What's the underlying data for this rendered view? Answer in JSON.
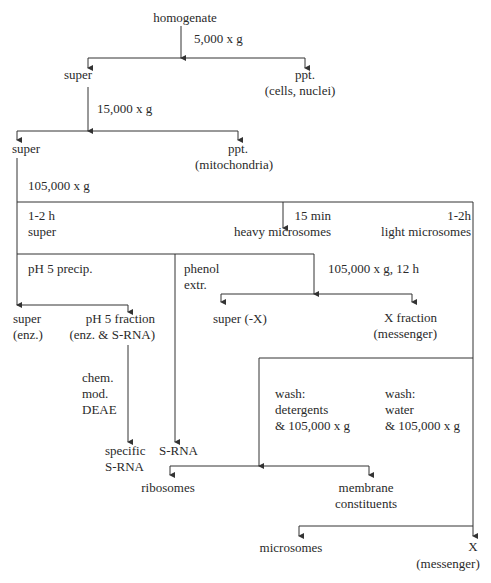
{
  "diagram": {
    "type": "flowchart",
    "nodes": {
      "homogenate": "homogenate",
      "step1_label": "5,000 x g",
      "super1": "super",
      "ppt1": "ppt.",
      "ppt1_sub": "(cells, nuclei)",
      "step2_label": "15,000 x g",
      "super2": "super",
      "ppt2": "ppt.",
      "ppt2_sub": "(mitochondria)",
      "step3_label": "105,000 x g",
      "time_a": "1-2 h",
      "super3": "super",
      "time_b": "15 min",
      "heavy_microsomes": "heavy microsomes",
      "time_c": "1-2h",
      "light_microsomes": "light microsomes",
      "ph5_precip": "pH 5 precip.",
      "phenol": "phenol",
      "extr": "extr.",
      "step4_label": "105,000 x g, 12 h",
      "super_enz": "super",
      "super_enz_sub": "(enz.)",
      "ph5_fraction": "pH 5 fraction",
      "ph5_fraction_sub": "(enz. & S-RNA)",
      "super_minus_x": "super (-X)",
      "x_fraction": "X fraction",
      "x_fraction_sub": "(messenger)",
      "chem": "chem.",
      "mod": "mod.",
      "deae": "DEAE",
      "wash1": "wash:",
      "wash1_a": "detergents",
      "wash1_b": "& 105,000 x g",
      "wash2": "wash:",
      "wash2_a": "water",
      "wash2_b": "& 105,000 x g",
      "specific": "specific",
      "specific_srna": "S-RNA",
      "srna": "S-RNA",
      "ribosomes": "ribosomes",
      "membrane": "membrane",
      "constituents": "constituents",
      "microsomes": "microsomes",
      "x_final": "X",
      "x_final_sub": "(messenger)"
    },
    "colors": {
      "line": "#333333",
      "text": "#2a2a2a",
      "background": "#ffffff"
    }
  }
}
